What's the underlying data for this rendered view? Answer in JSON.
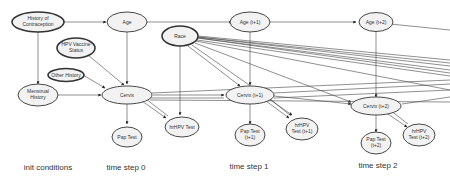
{
  "diagram": {
    "type": "dynamic-bayesian-network",
    "nodes": {
      "history_contraception": {
        "line1": "History of",
        "line2": "Contraception"
      },
      "menstrual_history": {
        "line1": "Menstrual",
        "line2": "History"
      },
      "hpv_vaccine": {
        "line1": "HPV Vaccine",
        "line2": "Status"
      },
      "other_history": {
        "line1": "Other History"
      },
      "race": {
        "line1": "Race"
      },
      "age0": {
        "line1": "Age"
      },
      "age1": {
        "line1": "Age (t+1)"
      },
      "age2": {
        "line1": "Age (t+2)"
      },
      "cervix0": {
        "line1": "Cervix"
      },
      "cervix1": {
        "line1": "Cervix (t+1)"
      },
      "cervix2": {
        "line1": "Cervix (t+2)"
      },
      "pap0": {
        "line1": "Pap Test"
      },
      "pap1": {
        "line1": "Pap Test",
        "line2": "(t+1)"
      },
      "pap2": {
        "line1": "Pap Test",
        "line2": "(t+2)"
      },
      "hrhpv0": {
        "line1": "hrHPV Test"
      },
      "hrhpv1": {
        "line1": "hrHPV",
        "line2": "Test (t+1)"
      },
      "hrhpv2": {
        "line1": "hrHPV",
        "line2": "Test (t+2)"
      }
    },
    "step_labels": {
      "init": "init conditions",
      "t0": "time step 0",
      "t1": "time step 1",
      "t2": "time step 2"
    },
    "colors": {
      "node_fill": "#f2f2f2",
      "node_stroke": "#333333",
      "edge": "#444444"
    }
  }
}
